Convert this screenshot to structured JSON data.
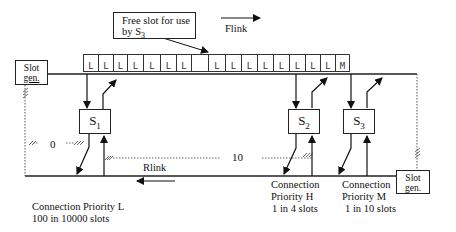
{
  "diagram": {
    "type": "dual-bus slot network",
    "note": {
      "line1": "Free slot for use",
      "line2_prefix": "by S",
      "line2_sub": "3"
    },
    "forward_link": {
      "label": "Flink",
      "direction": "right"
    },
    "reverse_link": {
      "label": "Rlink",
      "direction": "left"
    },
    "slot_generators": [
      {
        "id": "slotgen-left",
        "line1": "Slot",
        "line2": "gen."
      },
      {
        "id": "slotgen-right",
        "line1": "Slot",
        "line2": "gen."
      }
    ],
    "slots": [
      "L",
      "L",
      "L",
      "L",
      "L",
      "L",
      "L",
      "",
      "L",
      "L",
      "L",
      "L",
      "L",
      "L",
      "L",
      "L",
      "M"
    ],
    "stations": [
      {
        "name": "S",
        "sub": "1"
      },
      {
        "name": "S",
        "sub": "2"
      },
      {
        "name": "S",
        "sub": "3"
      }
    ],
    "distances": {
      "left": "0",
      "middle": "10"
    },
    "connections": [
      {
        "line1": "Connection Priority L",
        "line2": "100 in 10000 slots"
      },
      {
        "line1": "Connection",
        "line2": "Priority H",
        "line3": "1 in 4 slots"
      },
      {
        "line1": "Connection",
        "line2": "Priority M",
        "line3": "1 in 10 slots"
      }
    ]
  }
}
